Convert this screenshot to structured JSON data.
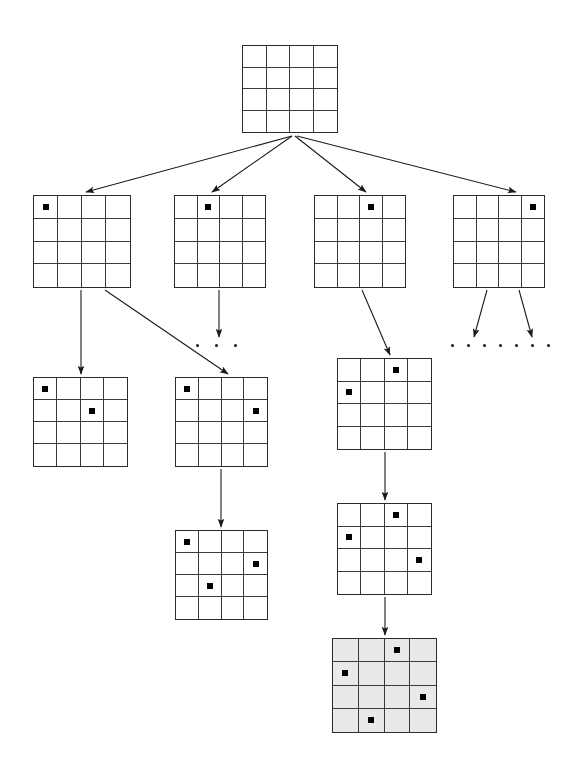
{
  "figure": {
    "board_size": 4,
    "colors": {
      "background": "#ffffff",
      "grid_line": "#3a3a3a",
      "grid_border": "#2b2b2b",
      "queen": "#000000",
      "arrow": "#1a1a1a",
      "solution_fill": "#e9e9e9"
    }
  },
  "boards": [
    {
      "id": "root",
      "label": "root-empty-board",
      "level": 0,
      "x": 242,
      "y": 45,
      "w": 96,
      "h": 88,
      "shaded": false,
      "queens": []
    },
    {
      "id": "l1-c0",
      "label": "level1-queen-col0",
      "level": 1,
      "x": 33,
      "y": 195,
      "w": 98,
      "h": 93,
      "shaded": false,
      "queens": [
        {
          "row": 0,
          "col": 0
        }
      ]
    },
    {
      "id": "l1-c1",
      "label": "level1-queen-col1",
      "level": 1,
      "x": 174,
      "y": 195,
      "w": 92,
      "h": 93,
      "shaded": false,
      "queens": [
        {
          "row": 0,
          "col": 1
        }
      ]
    },
    {
      "id": "l1-c2",
      "label": "level1-queen-col2",
      "level": 1,
      "x": 314,
      "y": 195,
      "w": 92,
      "h": 93,
      "shaded": false,
      "queens": [
        {
          "row": 0,
          "col": 2
        }
      ]
    },
    {
      "id": "l1-c3",
      "label": "level1-queen-col3",
      "level": 1,
      "x": 453,
      "y": 195,
      "w": 92,
      "h": 93,
      "shaded": false,
      "queens": [
        {
          "row": 0,
          "col": 3
        }
      ]
    },
    {
      "id": "l2-a",
      "label": "level2-board-left",
      "level": 2,
      "x": 33,
      "y": 377,
      "w": 95,
      "h": 90,
      "shaded": false,
      "queens": [
        {
          "row": 0,
          "col": 0
        },
        {
          "row": 1,
          "col": 2
        }
      ]
    },
    {
      "id": "l2-b",
      "label": "level2-board-middle",
      "level": 2,
      "x": 175,
      "y": 377,
      "w": 93,
      "h": 90,
      "shaded": false,
      "queens": [
        {
          "row": 0,
          "col": 0
        },
        {
          "row": 1,
          "col": 3
        }
      ]
    },
    {
      "id": "l2-c",
      "label": "level2-board-right",
      "level": 2,
      "x": 337,
      "y": 358,
      "w": 95,
      "h": 92,
      "shaded": false,
      "queens": [
        {
          "row": 0,
          "col": 2
        },
        {
          "row": 1,
          "col": 0
        }
      ]
    },
    {
      "id": "l3-b",
      "label": "level3-board-middle",
      "level": 3,
      "x": 175,
      "y": 530,
      "w": 93,
      "h": 90,
      "shaded": false,
      "queens": [
        {
          "row": 0,
          "col": 0
        },
        {
          "row": 1,
          "col": 3
        },
        {
          "row": 2,
          "col": 1
        }
      ]
    },
    {
      "id": "l3-c",
      "label": "level3-board-right",
      "level": 3,
      "x": 337,
      "y": 503,
      "w": 95,
      "h": 92,
      "shaded": false,
      "queens": [
        {
          "row": 0,
          "col": 2
        },
        {
          "row": 1,
          "col": 0
        },
        {
          "row": 2,
          "col": 3
        }
      ]
    },
    {
      "id": "l4-solution",
      "label": "solution-board-shaded",
      "level": 4,
      "x": 332,
      "y": 638,
      "w": 105,
      "h": 95,
      "shaded": true,
      "queens": [
        {
          "row": 0,
          "col": 2
        },
        {
          "row": 1,
          "col": 0
        },
        {
          "row": 2,
          "col": 3
        },
        {
          "row": 3,
          "col": 1
        }
      ]
    }
  ],
  "arrows": [
    {
      "id": "root-to-l1c0",
      "label": "arrow-root-to-col0",
      "x1": 292,
      "y1": 136,
      "x2": 86,
      "y2": 192
    },
    {
      "id": "root-to-l1c1",
      "label": "arrow-root-to-col1",
      "x1": 292,
      "y1": 136,
      "x2": 212,
      "y2": 192
    },
    {
      "id": "root-to-l1c2",
      "label": "arrow-root-to-col2",
      "x1": 295,
      "y1": 136,
      "x2": 366,
      "y2": 192
    },
    {
      "id": "root-to-l1c3",
      "label": "arrow-root-to-col3",
      "x1": 297,
      "y1": 136,
      "x2": 516,
      "y2": 192
    },
    {
      "id": "l1c0-to-l2a",
      "label": "arrow-col0-to-left-child",
      "x1": 81,
      "y1": 290,
      "x2": 81,
      "y2": 374
    },
    {
      "id": "l1c0-to-l2b",
      "label": "arrow-col0-to-middle-child",
      "x1": 105,
      "y1": 290,
      "x2": 228,
      "y2": 374
    },
    {
      "id": "l1c1-to-dots",
      "label": "arrow-col1-to-ellipsis",
      "x1": 219,
      "y1": 290,
      "x2": 219,
      "y2": 337
    },
    {
      "id": "l1c2-to-l2c",
      "label": "arrow-col2-to-right-child",
      "x1": 362,
      "y1": 290,
      "x2": 390,
      "y2": 355
    },
    {
      "id": "l1c3-to-dotsA",
      "label": "arrow-col3-to-ellipsis-left",
      "x1": 487,
      "y1": 290,
      "x2": 474,
      "y2": 337
    },
    {
      "id": "l1c3-to-dotsB",
      "label": "arrow-col3-to-ellipsis-right",
      "x1": 519,
      "y1": 290,
      "x2": 532,
      "y2": 337
    },
    {
      "id": "l2b-to-l3b",
      "label": "arrow-to-level3-middle",
      "x1": 221,
      "y1": 469,
      "x2": 221,
      "y2": 527
    },
    {
      "id": "l2c-to-l3c",
      "label": "arrow-to-level3-right",
      "x1": 385,
      "y1": 452,
      "x2": 385,
      "y2": 500
    },
    {
      "id": "l3c-to-solution",
      "label": "arrow-to-solution",
      "x1": 385,
      "y1": 597,
      "x2": 385,
      "y2": 635
    }
  ],
  "ellipses": [
    {
      "id": "dots-center",
      "label": "ellipsis-under-col1",
      "x": 196,
      "y": 344,
      "count": 3,
      "gap": 19
    },
    {
      "id": "dots-right",
      "label": "ellipsis-under-col3",
      "x": 451,
      "y": 344,
      "count": 7,
      "gap": 16
    }
  ]
}
